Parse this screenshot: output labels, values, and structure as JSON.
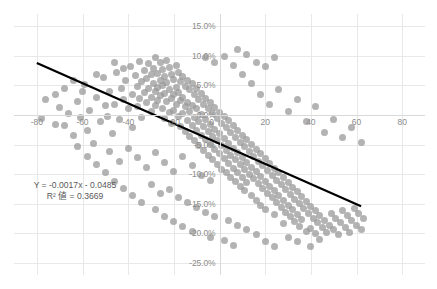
{
  "chart_data": {
    "type": "scatter",
    "title": "",
    "xlabel": "",
    "ylabel": "",
    "xlim": [
      -90,
      90
    ],
    "ylim": [
      -0.27,
      0.17
    ],
    "grid": true,
    "legend": false,
    "xticks": [
      -80,
      -60,
      -40,
      -20,
      0,
      20,
      40,
      60,
      80
    ],
    "xtick_labels": [
      "-80",
      "-60",
      "-40",
      "-20",
      "0",
      "20",
      "40",
      "60",
      "80"
    ],
    "yticks": [
      0.15,
      0.1,
      0.05,
      0.0,
      -0.05,
      -0.1,
      -0.15,
      -0.2,
      -0.25
    ],
    "ytick_labels": [
      "15.0%",
      "10.0%",
      "5.0%",
      "0.0%",
      "-5.0%",
      "-10.0%",
      "-15.0%",
      "-20.0%",
      "-25.0%"
    ],
    "point_color": "#969696",
    "trendline_color": "#000000",
    "annotation": {
      "equation": "Y = -0.0017x - 0.0485",
      "r_squared": "R² 値 = 0.3669",
      "slope": -0.0017,
      "intercept": -0.0485,
      "r2": 0.3669
    },
    "trendline": {
      "x_start": -80,
      "y_start": 0.0875,
      "x_end": -80,
      "y_end": -0.0485
    },
    "points": [
      [
        -72,
        0.035
      ],
      [
        -70,
        0.012
      ],
      [
        -68,
        -0.018
      ],
      [
        -66,
        0.002
      ],
      [
        -64,
        -0.035
      ],
      [
        -62,
        0.022
      ],
      [
        -61,
        -0.005
      ],
      [
        -59,
        0.051
      ],
      [
        -58,
        -0.026
      ],
      [
        -57,
        0.007
      ],
      [
        -55,
        -0.049
      ],
      [
        -54,
        0.03
      ],
      [
        -52,
        -0.012
      ],
      [
        -51,
        0.063
      ],
      [
        -49,
        -0.003
      ],
      [
        -48,
        0.04
      ],
      [
        -47,
        -0.032
      ],
      [
        -46,
        0.018
      ],
      [
        -45,
        0.072
      ],
      [
        -44,
        -0.008
      ],
      [
        -43,
        0.045
      ],
      [
        -42,
        0.026
      ],
      [
        -41,
        0.058
      ],
      [
        -40,
        0.01
      ],
      [
        -39,
        0.082
      ],
      [
        -38,
        0.034
      ],
      [
        -38,
        -0.022
      ],
      [
        -37,
        0.066
      ],
      [
        -36,
        0.048
      ],
      [
        -36,
        0.014
      ],
      [
        -35,
        0.09
      ],
      [
        -35,
        0.028
      ],
      [
        -34,
        0.056
      ],
      [
        -34,
        -0.004
      ],
      [
        -33,
        0.074
      ],
      [
        -33,
        0.038
      ],
      [
        -32,
        0.062
      ],
      [
        -32,
        0.02
      ],
      [
        -31,
        0.086
      ],
      [
        -31,
        0.044
      ],
      [
        -30,
        0.068
      ],
      [
        -30,
        0.03
      ],
      [
        -30,
        0.006
      ],
      [
        -29,
        0.078
      ],
      [
        -29,
        0.052
      ],
      [
        -28,
        0.096
      ],
      [
        -28,
        0.04
      ],
      [
        -28,
        0.016
      ],
      [
        -27,
        0.07
      ],
      [
        -27,
        0.046
      ],
      [
        -27,
        0.024
      ],
      [
        -26,
        0.088
      ],
      [
        -26,
        0.058
      ],
      [
        -26,
        0.032
      ],
      [
        -25,
        0.076
      ],
      [
        -25,
        0.05
      ],
      [
        -25,
        0.01
      ],
      [
        -24,
        0.064
      ],
      [
        -24,
        0.036
      ],
      [
        -24,
        -0.006
      ],
      [
        -23,
        0.092
      ],
      [
        -23,
        0.054
      ],
      [
        -23,
        0.022
      ],
      [
        -22,
        0.08
      ],
      [
        -22,
        0.042
      ],
      [
        -22,
        0.004
      ],
      [
        -21,
        0.068
      ],
      [
        -21,
        0.028
      ],
      [
        -21,
        -0.014
      ],
      [
        -20,
        0.06
      ],
      [
        -20,
        0.034
      ],
      [
        -20,
        0.008
      ],
      [
        -19,
        0.084
      ],
      [
        -19,
        0.046
      ],
      [
        -19,
        0.018
      ],
      [
        -18,
        0.072
      ],
      [
        -18,
        0.038
      ],
      [
        -18,
        -0.002
      ],
      [
        -17,
        0.056
      ],
      [
        -17,
        0.024
      ],
      [
        -17,
        -0.02
      ],
      [
        -16,
        0.064
      ],
      [
        -16,
        0.03
      ],
      [
        -16,
        0.002
      ],
      [
        -15,
        0.048
      ],
      [
        -15,
        0.014
      ],
      [
        -15,
        -0.028
      ],
      [
        -14,
        0.058
      ],
      [
        -14,
        0.02
      ],
      [
        -14,
        -0.01
      ],
      [
        -13,
        0.042
      ],
      [
        -13,
        0.006
      ],
      [
        -13,
        -0.036
      ],
      [
        -12,
        0.052
      ],
      [
        -12,
        0.016
      ],
      [
        -12,
        -0.018
      ],
      [
        -11,
        0.034
      ],
      [
        -11,
        -0.004
      ],
      [
        -11,
        -0.044
      ],
      [
        -10,
        0.044
      ],
      [
        -10,
        0.01
      ],
      [
        -10,
        -0.026
      ],
      [
        -9,
        0.026
      ],
      [
        -9,
        -0.012
      ],
      [
        -9,
        -0.052
      ],
      [
        -8,
        0.036
      ],
      [
        -8,
        0.0
      ],
      [
        -8,
        -0.034
      ],
      [
        -7,
        0.018
      ],
      [
        -7,
        -0.02
      ],
      [
        -7,
        -0.06
      ],
      [
        -6,
        0.028
      ],
      [
        -6,
        -0.008
      ],
      [
        -6,
        -0.042
      ],
      [
        -5,
        0.01
      ],
      [
        -5,
        -0.028
      ],
      [
        -5,
        -0.068
      ],
      [
        -4,
        0.02
      ],
      [
        -4,
        -0.016
      ],
      [
        -4,
        -0.05
      ],
      [
        -3,
        0.002
      ],
      [
        -3,
        -0.036
      ],
      [
        -3,
        -0.076
      ],
      [
        -2,
        0.012
      ],
      [
        -2,
        -0.024
      ],
      [
        -2,
        -0.058
      ],
      [
        -1,
        -0.006
      ],
      [
        -1,
        -0.044
      ],
      [
        -1,
        -0.084
      ],
      [
        0,
        0.004
      ],
      [
        0,
        -0.032
      ],
      [
        0,
        -0.066
      ],
      [
        1,
        -0.014
      ],
      [
        1,
        -0.052
      ],
      [
        1,
        -0.092
      ],
      [
        2,
        -0.002
      ],
      [
        2,
        -0.04
      ],
      [
        2,
        -0.074
      ],
      [
        3,
        -0.022
      ],
      [
        3,
        -0.06
      ],
      [
        3,
        -0.098
      ],
      [
        4,
        -0.01
      ],
      [
        4,
        -0.048
      ],
      [
        4,
        -0.082
      ],
      [
        5,
        -0.03
      ],
      [
        5,
        -0.068
      ],
      [
        5,
        -0.105
      ],
      [
        6,
        -0.018
      ],
      [
        6,
        -0.056
      ],
      [
        6,
        -0.09
      ],
      [
        7,
        -0.038
      ],
      [
        7,
        -0.076
      ],
      [
        7,
        -0.112
      ],
      [
        8,
        -0.026
      ],
      [
        8,
        -0.064
      ],
      [
        8,
        -0.098
      ],
      [
        9,
        -0.046
      ],
      [
        9,
        -0.084
      ],
      [
        9,
        -0.12
      ],
      [
        10,
        -0.034
      ],
      [
        10,
        -0.072
      ],
      [
        10,
        -0.106
      ],
      [
        11,
        -0.054
      ],
      [
        11,
        -0.092
      ],
      [
        11,
        -0.128
      ],
      [
        12,
        -0.042
      ],
      [
        12,
        -0.08
      ],
      [
        12,
        -0.114
      ],
      [
        13,
        -0.062
      ],
      [
        13,
        -0.1
      ],
      [
        14,
        -0.05
      ],
      [
        14,
        -0.088
      ],
      [
        14,
        -0.136
      ],
      [
        15,
        -0.07
      ],
      [
        15,
        -0.108
      ],
      [
        16,
        -0.058
      ],
      [
        16,
        -0.096
      ],
      [
        16,
        -0.144
      ],
      [
        17,
        -0.078
      ],
      [
        17,
        -0.116
      ],
      [
        18,
        -0.066
      ],
      [
        18,
        -0.104
      ],
      [
        18,
        -0.152
      ],
      [
        19,
        -0.086
      ],
      [
        19,
        -0.124
      ],
      [
        20,
        -0.074
      ],
      [
        20,
        -0.112
      ],
      [
        20,
        -0.16
      ],
      [
        21,
        -0.094
      ],
      [
        21,
        -0.132
      ],
      [
        22,
        -0.082
      ],
      [
        22,
        -0.12
      ],
      [
        23,
        -0.102
      ],
      [
        23,
        -0.14
      ],
      [
        24,
        -0.09
      ],
      [
        24,
        -0.128
      ],
      [
        24,
        -0.168
      ],
      [
        25,
        -0.11
      ],
      [
        25,
        -0.148
      ],
      [
        26,
        -0.098
      ],
      [
        26,
        -0.136
      ],
      [
        27,
        -0.118
      ],
      [
        27,
        -0.156
      ],
      [
        28,
        -0.106
      ],
      [
        28,
        -0.144
      ],
      [
        28,
        -0.184
      ],
      [
        29,
        -0.126
      ],
      [
        29,
        -0.164
      ],
      [
        30,
        -0.114
      ],
      [
        30,
        -0.152
      ],
      [
        31,
        -0.134
      ],
      [
        31,
        -0.172
      ],
      [
        32,
        -0.122
      ],
      [
        32,
        -0.16
      ],
      [
        33,
        -0.142
      ],
      [
        33,
        -0.18
      ],
      [
        34,
        -0.13
      ],
      [
        34,
        -0.168
      ],
      [
        35,
        -0.15
      ],
      [
        35,
        -0.188
      ],
      [
        36,
        -0.138
      ],
      [
        36,
        -0.176
      ],
      [
        37,
        -0.158
      ],
      [
        38,
        -0.146
      ],
      [
        38,
        -0.196
      ],
      [
        39,
        -0.166
      ],
      [
        40,
        -0.154
      ],
      [
        40,
        -0.192
      ],
      [
        41,
        -0.174
      ],
      [
        42,
        -0.162
      ],
      [
        42,
        -0.2
      ],
      [
        43,
        -0.182
      ],
      [
        44,
        -0.17
      ],
      [
        45,
        -0.19
      ],
      [
        46,
        -0.178
      ],
      [
        47,
        -0.198
      ],
      [
        48,
        -0.186
      ],
      [
        49,
        -0.166
      ],
      [
        50,
        -0.194
      ],
      [
        51,
        -0.174
      ],
      [
        52,
        -0.202
      ],
      [
        53,
        -0.182
      ],
      [
        54,
        -0.162
      ],
      [
        55,
        -0.19
      ],
      [
        56,
        -0.17
      ],
      [
        57,
        -0.198
      ],
      [
        58,
        -0.178
      ],
      [
        59,
        -0.158
      ],
      [
        60,
        -0.186
      ],
      [
        61,
        -0.166
      ],
      [
        62,
        -0.194
      ],
      [
        63,
        -0.174
      ],
      [
        18,
        0.035
      ],
      [
        22,
        0.018
      ],
      [
        26,
        0.042
      ],
      [
        30,
        0.006
      ],
      [
        34,
        0.026
      ],
      [
        38,
        -0.012
      ],
      [
        42,
        0.014
      ],
      [
        46,
        -0.03
      ],
      [
        50,
        -0.008
      ],
      [
        54,
        -0.038
      ],
      [
        58,
        -0.022
      ],
      [
        62,
        -0.046
      ],
      [
        14,
        0.052
      ],
      [
        10,
        0.068
      ],
      [
        6,
        0.084
      ],
      [
        2,
        0.098
      ],
      [
        -2,
        0.088
      ],
      [
        -6,
        0.096
      ],
      [
        16,
        0.088
      ],
      [
        20,
        0.082
      ],
      [
        24,
        0.096
      ],
      [
        12,
        0.102
      ],
      [
        8,
        0.11
      ],
      [
        -48,
        -0.062
      ],
      [
        -44,
        -0.078
      ],
      [
        -40,
        -0.056
      ],
      [
        -36,
        -0.072
      ],
      [
        -32,
        -0.088
      ],
      [
        -28,
        -0.064
      ],
      [
        -24,
        -0.08
      ],
      [
        -20,
        -0.096
      ],
      [
        -16,
        -0.07
      ],
      [
        -12,
        -0.086
      ],
      [
        -8,
        -0.102
      ],
      [
        -4,
        -0.11
      ],
      [
        -60,
        0.04
      ],
      [
        -64,
        0.058
      ],
      [
        -68,
        0.044
      ],
      [
        -72,
        -0.016
      ],
      [
        -76,
        0.026
      ],
      [
        -78,
        -0.006
      ],
      [
        -30,
        -0.118
      ],
      [
        -26,
        -0.132
      ],
      [
        -22,
        -0.126
      ],
      [
        -18,
        -0.14
      ],
      [
        -14,
        -0.148
      ],
      [
        -10,
        -0.156
      ],
      [
        -6,
        -0.164
      ],
      [
        -2,
        -0.172
      ],
      [
        4,
        -0.178
      ],
      [
        8,
        -0.186
      ],
      [
        12,
        -0.194
      ],
      [
        16,
        -0.202
      ],
      [
        2,
        -0.212
      ],
      [
        6,
        -0.22
      ],
      [
        -4,
        -0.206
      ],
      [
        20,
        -0.214
      ],
      [
        24,
        -0.222
      ],
      [
        -12,
        -0.196
      ],
      [
        -16,
        -0.188
      ],
      [
        -20,
        -0.18
      ],
      [
        -24,
        -0.172
      ],
      [
        -28,
        -0.16
      ],
      [
        -34,
        -0.148
      ],
      [
        -38,
        -0.136
      ],
      [
        -42,
        -0.124
      ],
      [
        -46,
        -0.112
      ],
      [
        -50,
        -0.098
      ],
      [
        -54,
        -0.084
      ],
      [
        -58,
        -0.07
      ],
      [
        -62,
        -0.054
      ],
      [
        30,
        -0.206
      ],
      [
        34,
        -0.214
      ],
      [
        40,
        -0.222
      ],
      [
        44,
        -0.21
      ],
      [
        -50,
        0.016
      ],
      [
        -46,
        0.088
      ],
      [
        -42,
        0.078
      ],
      [
        -54,
        0.068
      ]
    ]
  }
}
